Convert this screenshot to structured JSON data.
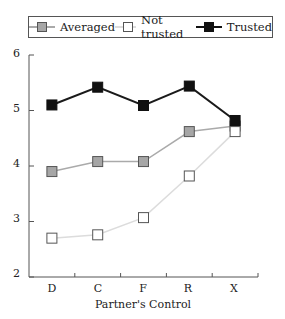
{
  "chart_data": {
    "type": "line",
    "title": "",
    "xlabel": "Partner's Control",
    "ylabel": "",
    "categories": [
      "D",
      "C",
      "F",
      "R",
      "X"
    ],
    "ylim": [
      2,
      6
    ],
    "yticks": [
      2,
      3,
      4,
      5,
      6
    ],
    "grid": false,
    "legend_position": "top",
    "series": [
      {
        "name": "Averaged",
        "values": [
          3.9,
          4.08,
          4.08,
          4.62,
          4.72
        ],
        "line_color": "#aaaaaa",
        "marker_fill": "#a6a6a6",
        "marker_stroke": "#555555"
      },
      {
        "name": "Not trusted",
        "values": [
          2.7,
          2.76,
          3.07,
          3.82,
          4.62
        ],
        "line_color": "#dcdcdc",
        "marker_fill": "#ffffff",
        "marker_stroke": "#555555"
      },
      {
        "name": "Trusted",
        "values": [
          5.1,
          5.42,
          5.09,
          5.44,
          4.82
        ],
        "line_color": "#1a1a1a",
        "marker_fill": "#111111",
        "marker_stroke": "#111111"
      }
    ]
  },
  "legend": {
    "items": [
      {
        "label": "Averaged"
      },
      {
        "label": "Not trusted"
      },
      {
        "label": "Trusted"
      }
    ]
  },
  "axes": {
    "y_labels": [
      "6",
      "5",
      "4",
      "3",
      "2"
    ],
    "x_labels": [
      "D",
      "C",
      "F",
      "R",
      "X"
    ],
    "x_title": "Partner's Control"
  }
}
